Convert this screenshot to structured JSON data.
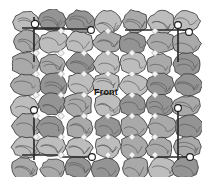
{
  "figure": {
    "name": "cobblestone-grid-diagram",
    "background_color": "#ffffff",
    "width": 212,
    "height": 185,
    "label_front": "Front"
  },
  "palette": {
    "stone_fill": "#a9a9a9",
    "stone_fill_light": "#bdbdbd",
    "stone_fill_dark": "#949494",
    "stone_outline": "#3a3a3a",
    "stone_crack": "#5a5a5a",
    "grid_line": "#2b2b2b",
    "marker_circle_fill": "#ffffff",
    "marker_circle_stroke": "#1a1a1a",
    "marker_diamond_fill": "#f2f2f2",
    "marker_diamond_stroke": "#8c8c8c",
    "text_color": "#15120f"
  },
  "grid": {
    "columns": 7,
    "rows": 8,
    "cell_width": 27,
    "cell_height": 21,
    "origin_x": 12,
    "origin_y": 11
  },
  "measurement_lines": [
    {
      "id": "top-left-horizontal",
      "x1": 22,
      "y1": 28,
      "x2": 65,
      "y2": 28
    },
    {
      "id": "top-left-vertical",
      "x1": 34,
      "y1": 17,
      "x2": 34,
      "y2": 62
    },
    {
      "id": "top-mid-horizontal",
      "x1": 34,
      "y1": 29,
      "x2": 92,
      "y2": 29
    },
    {
      "id": "top-right-horizontal",
      "x1": 125,
      "y1": 30,
      "x2": 186,
      "y2": 30
    },
    {
      "id": "top-right-vertical",
      "x1": 178,
      "y1": 22,
      "x2": 178,
      "y2": 62
    },
    {
      "id": "left-vertical-lower",
      "x1": 34,
      "y1": 108,
      "x2": 34,
      "y2": 160
    },
    {
      "id": "right-vertical-lower",
      "x1": 178,
      "y1": 108,
      "x2": 178,
      "y2": 160
    },
    {
      "id": "bottom-left-horizontal",
      "x1": 22,
      "y1": 155,
      "x2": 60,
      "y2": 155
    },
    {
      "id": "bottom-mid-horizontal",
      "x1": 60,
      "y1": 157,
      "x2": 93,
      "y2": 157
    },
    {
      "id": "bottom-right-horizontal",
      "x1": 150,
      "y1": 157,
      "x2": 192,
      "y2": 157
    }
  ],
  "circle_markers": [
    {
      "id": "marker-top-left",
      "cx": 35,
      "cy": 24,
      "r": 3.6
    },
    {
      "id": "marker-top-center",
      "cx": 91,
      "cy": 30,
      "r": 3.4
    },
    {
      "id": "marker-top-right-inner",
      "cx": 178,
      "cy": 25,
      "r": 3.4
    },
    {
      "id": "marker-top-right-outer",
      "cx": 189,
      "cy": 32,
      "r": 3.4
    },
    {
      "id": "marker-left-middle",
      "cx": 34,
      "cy": 110,
      "r": 3.4
    },
    {
      "id": "marker-right-middle",
      "cx": 178,
      "cy": 108,
      "r": 3.4
    },
    {
      "id": "marker-bottom-center",
      "cx": 92,
      "cy": 157,
      "r": 3.4
    },
    {
      "id": "marker-bottom-right",
      "cx": 190,
      "cy": 157,
      "r": 3.4
    }
  ],
  "diamond_markers": [
    {
      "id": "node-r1-c2",
      "cx": 61,
      "cy": 31
    },
    {
      "id": "node-r1-c4",
      "cx": 108,
      "cy": 31
    },
    {
      "id": "node-r1-c6",
      "cx": 155,
      "cy": 31
    },
    {
      "id": "node-r2-c1",
      "cx": 36,
      "cy": 53
    },
    {
      "id": "node-r2-c2",
      "cx": 61,
      "cy": 53
    },
    {
      "id": "node-r2-c3",
      "cx": 84,
      "cy": 53
    },
    {
      "id": "node-r2-c4",
      "cx": 108,
      "cy": 53
    },
    {
      "id": "node-r2-c5",
      "cx": 132,
      "cy": 53
    },
    {
      "id": "node-r2-c6",
      "cx": 155,
      "cy": 53
    },
    {
      "id": "node-r3-c1",
      "cx": 36,
      "cy": 74
    },
    {
      "id": "node-r3-c2",
      "cx": 61,
      "cy": 74
    },
    {
      "id": "node-r3-c3",
      "cx": 84,
      "cy": 74
    },
    {
      "id": "node-r3-c4",
      "cx": 108,
      "cy": 74
    },
    {
      "id": "node-r3-c5",
      "cx": 132,
      "cy": 74
    },
    {
      "id": "node-r3-c6",
      "cx": 155,
      "cy": 74
    },
    {
      "id": "node-r4-c1",
      "cx": 36,
      "cy": 95
    },
    {
      "id": "node-r4-c2",
      "cx": 61,
      "cy": 95
    },
    {
      "id": "node-r4-c3",
      "cx": 84,
      "cy": 95
    },
    {
      "id": "node-r4-c5",
      "cx": 132,
      "cy": 95
    },
    {
      "id": "node-r4-c6",
      "cx": 155,
      "cy": 95
    },
    {
      "id": "node-r5-c1",
      "cx": 36,
      "cy": 116
    },
    {
      "id": "node-r5-c2",
      "cx": 61,
      "cy": 116
    },
    {
      "id": "node-r5-c3",
      "cx": 84,
      "cy": 116
    },
    {
      "id": "node-r5-c4",
      "cx": 108,
      "cy": 116
    },
    {
      "id": "node-r5-c5",
      "cx": 132,
      "cy": 116
    },
    {
      "id": "node-r5-c6",
      "cx": 155,
      "cy": 116
    },
    {
      "id": "node-r6-c1",
      "cx": 36,
      "cy": 137
    },
    {
      "id": "node-r6-c2",
      "cx": 61,
      "cy": 137
    },
    {
      "id": "node-r6-c3",
      "cx": 84,
      "cy": 137
    },
    {
      "id": "node-r6-c4",
      "cx": 108,
      "cy": 137
    },
    {
      "id": "node-r6-c5",
      "cx": 132,
      "cy": 137
    },
    {
      "id": "node-r6-c6",
      "cx": 155,
      "cy": 137
    },
    {
      "id": "node-r7-c2",
      "cx": 61,
      "cy": 155
    },
    {
      "id": "node-r7-c4",
      "cx": 108,
      "cy": 155
    },
    {
      "id": "node-r7-c5",
      "cx": 132,
      "cy": 155
    },
    {
      "id": "node-r7-c6",
      "cx": 155,
      "cy": 155
    }
  ]
}
